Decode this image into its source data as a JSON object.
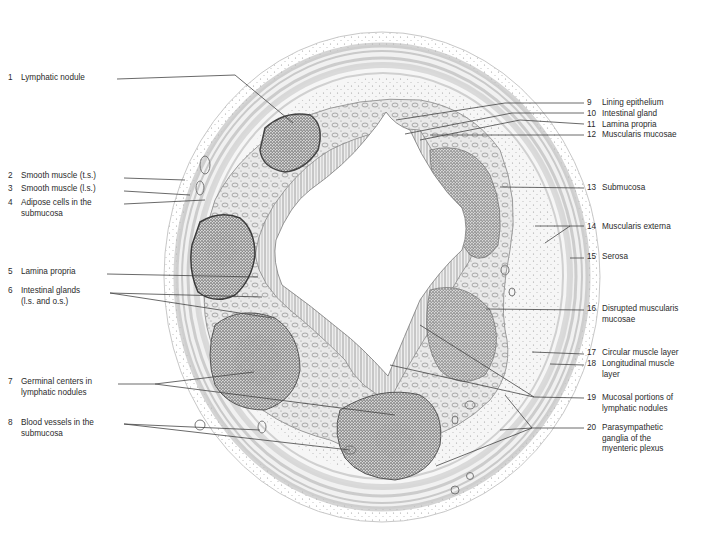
{
  "figure": {
    "type": "histology-illustration",
    "lumen_center": [
      395,
      250
    ],
    "colors": {
      "background": "#ffffff",
      "ink": "#3a3a3a",
      "stipple_dark": "#4a4a4a",
      "stipple_light": "#9a9a9a",
      "muscle_band": "#c4c4c4",
      "leader_line": "#444444"
    }
  },
  "labels_left": [
    {
      "n": "1",
      "text": "Lymphatic nodule",
      "line2": "",
      "x": 8,
      "y": 73,
      "leaders": [
        [
          [
            117,
            79
          ],
          [
            235,
            75
          ],
          [
            293,
            123
          ]
        ]
      ]
    },
    {
      "n": "2",
      "text": "Smooth muscle (t.s.)",
      "line2": "",
      "x": 8,
      "y": 171,
      "leaders": [
        [
          [
            124,
            178
          ],
          [
            185,
            180
          ]
        ]
      ]
    },
    {
      "n": "3",
      "text": "Smooth muscle (l.s.)",
      "line2": "",
      "x": 8,
      "y": 184,
      "leaders": [
        [
          [
            124,
            191
          ],
          [
            190,
            195
          ]
        ]
      ]
    },
    {
      "n": "4",
      "text": "Adipose cells in the",
      "line2": "submucosa",
      "x": 8,
      "y": 198,
      "leaders": [
        [
          [
            124,
            204
          ],
          [
            205,
            200
          ]
        ]
      ]
    },
    {
      "n": "5",
      "text": "Lamina propria",
      "line2": "",
      "x": 8,
      "y": 267,
      "leaders": [
        [
          [
            107,
            274
          ],
          [
            258,
            277
          ]
        ]
      ]
    },
    {
      "n": "6",
      "text": "Intestinal glands",
      "line2": "(l.s. and o.s.)",
      "x": 8,
      "y": 286,
      "leaders": [
        [
          [
            110,
            293
          ],
          [
            262,
            297
          ]
        ],
        [
          [
            110,
            293
          ],
          [
            272,
            318
          ]
        ]
      ]
    },
    {
      "n": "7",
      "text": "Germinal centers in",
      "line2": "lymphatic nodules",
      "x": 8,
      "y": 377,
      "leaders": [
        [
          [
            118,
            384
          ],
          [
            155,
            384
          ],
          [
            254,
            372
          ]
        ],
        [
          [
            155,
            384
          ],
          [
            395,
            415
          ]
        ]
      ]
    },
    {
      "n": "8",
      "text": "Blood vessels in the",
      "line2": "submucosa",
      "x": 8,
      "y": 418,
      "leaders": [
        [
          [
            124,
            424
          ],
          [
            260,
            430
          ]
        ],
        [
          [
            124,
            424
          ],
          [
            350,
            450
          ]
        ]
      ]
    }
  ],
  "labels_right": [
    {
      "n": "9",
      "text": "Lining epithelium",
      "line2": "",
      "x": 587,
      "y": 98,
      "leaders": [
        [
          [
            584,
            103
          ],
          [
            505,
            103
          ],
          [
            396,
            120
          ]
        ]
      ]
    },
    {
      "n": "10",
      "text": "Intestinal gland",
      "line2": "",
      "x": 587,
      "y": 109,
      "leaders": [
        [
          [
            584,
            113
          ],
          [
            512,
            113
          ],
          [
            405,
            134
          ]
        ]
      ]
    },
    {
      "n": "11",
      "text": "Lamina propria",
      "line2": "",
      "x": 587,
      "y": 120,
      "leaders": [
        [
          [
            584,
            124
          ],
          [
            520,
            120
          ],
          [
            420,
            140
          ]
        ]
      ]
    },
    {
      "n": "12",
      "text": "Muscularis mucosae",
      "line2": "",
      "x": 587,
      "y": 130,
      "leaders": [
        [
          [
            584,
            135
          ],
          [
            430,
            135
          ]
        ]
      ]
    },
    {
      "n": "13",
      "text": "Submucosa",
      "line2": "",
      "x": 587,
      "y": 183,
      "leaders": [
        [
          [
            584,
            188
          ],
          [
            500,
            187
          ]
        ]
      ]
    },
    {
      "n": "14",
      "text": "Muscularis externa",
      "line2": "",
      "x": 587,
      "y": 222,
      "leaders": [
        [
          [
            584,
            226
          ],
          [
            570,
            226
          ],
          [
            535,
            226
          ]
        ],
        [
          [
            570,
            226
          ],
          [
            545,
            243
          ]
        ]
      ]
    },
    {
      "n": "15",
      "text": "Serosa",
      "line2": "",
      "x": 587,
      "y": 252,
      "leaders": [
        [
          [
            584,
            258
          ],
          [
            570,
            258
          ]
        ]
      ]
    },
    {
      "n": "16",
      "text": "Disrupted muscularis",
      "line2": "mucosae",
      "x": 587,
      "y": 304,
      "leaders": [
        [
          [
            584,
            310
          ],
          [
            486,
            309
          ]
        ]
      ]
    },
    {
      "n": "17",
      "text": "Circular muscle layer",
      "line2": "",
      "x": 587,
      "y": 348,
      "leaders": [
        [
          [
            584,
            354
          ],
          [
            532,
            352
          ]
        ]
      ]
    },
    {
      "n": "18",
      "text": "Longitudinal muscle",
      "line2": "layer",
      "x": 587,
      "y": 359,
      "leaders": [
        [
          [
            584,
            365
          ],
          [
            550,
            364
          ]
        ]
      ]
    },
    {
      "n": "19",
      "text": "Mucosal portions of",
      "line2": "lymphatic nodules",
      "x": 587,
      "y": 393,
      "leaders": [
        [
          [
            584,
            398
          ],
          [
            534,
            397
          ],
          [
            420,
            325
          ]
        ],
        [
          [
            534,
            397
          ],
          [
            390,
            365
          ]
        ]
      ]
    },
    {
      "n": "20",
      "text": "Parasympathetic",
      "line2": "ganglia of the",
      "line3": "myenteric plexus",
      "x": 587,
      "y": 423,
      "leaders": [
        [
          [
            584,
            428
          ],
          [
            532,
            428
          ],
          [
            505,
            395
          ]
        ],
        [
          [
            532,
            428
          ],
          [
            500,
            430
          ]
        ],
        [
          [
            532,
            428
          ],
          [
            436,
            466
          ]
        ]
      ]
    }
  ]
}
